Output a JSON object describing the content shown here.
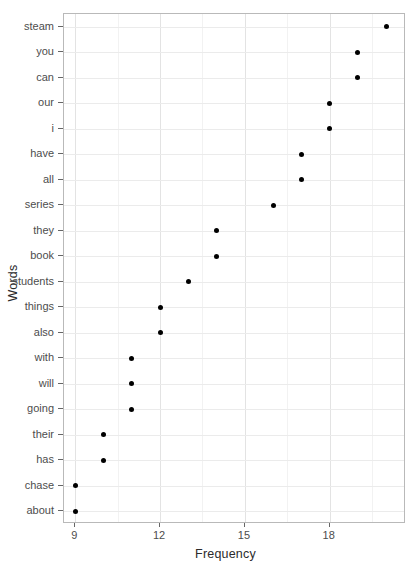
{
  "chart_data": {
    "type": "scatter",
    "title": "",
    "xlabel": "Frequency",
    "ylabel": "Words",
    "categories": [
      "steam",
      "you",
      "can",
      "our",
      "i",
      "have",
      "all",
      "series",
      "they",
      "book",
      "students",
      "things",
      "also",
      "with",
      "will",
      "going",
      "their",
      "has",
      "chase",
      "about"
    ],
    "values": [
      20,
      19,
      19,
      18,
      18,
      17,
      17,
      16,
      14,
      14,
      13,
      12,
      12,
      11,
      11,
      11,
      10,
      10,
      9,
      9
    ],
    "xticks": [
      9,
      12,
      15,
      18
    ],
    "xminorticks": [
      10.5,
      13.5,
      16.5,
      19.5
    ],
    "xlim": [
      8.6,
      20.7
    ],
    "grid": true,
    "legend": null,
    "point_color": "#000000",
    "panel_border_color": "#b9b9b9",
    "grid_color": "#ebebeb"
  }
}
